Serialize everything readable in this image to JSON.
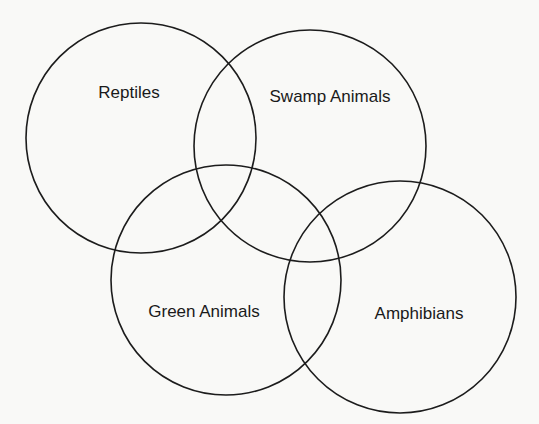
{
  "diagram": {
    "type": "venn",
    "stroke_color": "#1c1c1c",
    "background_color": "#f9f9f7",
    "sets": [
      {
        "label": "Reptiles",
        "cx": 141,
        "cy": 138,
        "r": 115,
        "label_x": 129,
        "label_y": 98
      },
      {
        "label": "Swamp Animals",
        "cx": 310,
        "cy": 146,
        "r": 116,
        "label_x": 330,
        "label_y": 102
      },
      {
        "label": "Green Animals",
        "cx": 226,
        "cy": 280,
        "r": 115,
        "label_x": 204,
        "label_y": 317
      },
      {
        "label": "Amphibians",
        "cx": 400,
        "cy": 297,
        "r": 116,
        "label_x": 419,
        "label_y": 319
      }
    ]
  }
}
